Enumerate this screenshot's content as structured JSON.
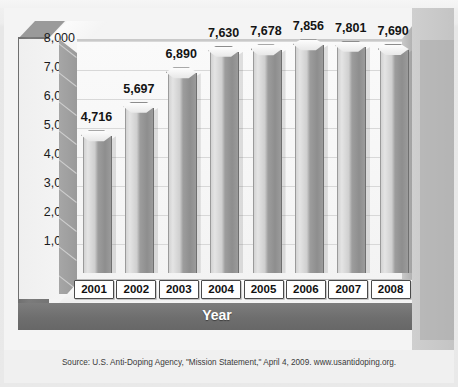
{
  "chart_data": {
    "type": "bar",
    "title": "",
    "xlabel": "Year",
    "ylabel": "Number of Tests",
    "categories": [
      "2001",
      "2002",
      "2003",
      "2004",
      "2005",
      "2006",
      "2007",
      "2008"
    ],
    "values": [
      4716,
      5697,
      6890,
      7630,
      7678,
      7856,
      7801,
      7690
    ],
    "value_labels": [
      "4,716",
      "5,697",
      "6,890",
      "7,630",
      "7,678",
      "7,856",
      "7,801",
      "7,690"
    ],
    "ylim": [
      0,
      8000
    ],
    "ytick_labels": [
      "8,000",
      "7,000",
      "6,000",
      "5,000",
      "4,000",
      "3,000",
      "2,000",
      "1,000",
      "0"
    ],
    "ytick_values": [
      8000,
      7000,
      6000,
      5000,
      4000,
      3000,
      2000,
      1000,
      0
    ],
    "grid": true,
    "legend": "none",
    "style": "3d-column",
    "colors": {
      "bar_light": "#e4e4e4",
      "bar_dark": "#8e8e8e",
      "frame": "#757575",
      "plot_background": "#f7f7f7",
      "gridline": "#d8d8d8",
      "label_text": "#141414",
      "axis_title_text": "#ffffff"
    }
  },
  "source": {
    "note": "Source: U.S. Anti-Doping Agency, \"Mission Statement,\" April 4, 2009. www.usantidoping.org."
  }
}
